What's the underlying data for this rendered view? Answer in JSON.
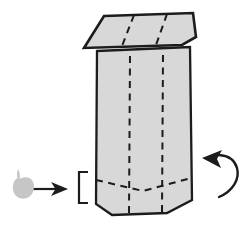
{
  "colors": {
    "background": "#ffffff",
    "paper_fill": "#d8d8d8",
    "outline": "#1c1c1c",
    "fold_line": "#1c1c1c",
    "scrap_fill": "#c6c6c6"
  },
  "icons": {
    "insert_arrow": "right-arrow-icon",
    "rotate_arrow": "curved-counterclockwise-arrow-icon",
    "bracket": "left-square-bracket-icon",
    "scrap": "paper-scrap-icon"
  },
  "shapes": {
    "body": "97,51 190,47 192,200 167,213 112,215 96,204",
    "roof": "104,16 193,13 196,37 182,45 84,48",
    "roof_fold_1": "M134,15 L122,46",
    "roof_fold_2": "M167,14 L156,45",
    "body_fold_left": "M130,56 L129,214",
    "body_fold_right": "M163,55 L162,212",
    "bottom_fold": "M96,180 L143,191 L191,178",
    "bracket": "M88,172 L79,172 L79,203 L88,203",
    "insert_arrow_shaft": "M33,189 L57,189",
    "insert_arrow_head": "68,189 51,182 55.5,189 51,196",
    "rotate_arc": "M219,197 C233,191 240,179 237,168 C234.5,159.5 228,155.5 219,155",
    "rotate_arrow_head": "202,158 222,150 217,159 221,168",
    "scrap": "M18,169 C20,173 20.5,176 19.5,179 C25,175.5 32,177.5 33.5,183 C35,189 33,195.5 27,198 C20.5,200.5 14,196.5 13,190 C12.2,184 14.5,179.5 17.5,178 C16.5,175 17,171.5 18,169 Z"
  }
}
